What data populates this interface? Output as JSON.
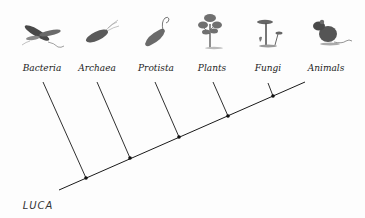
{
  "diagram": {
    "type": "cladogram",
    "root": {
      "label": "LUCA",
      "x": 38,
      "y": 209
    },
    "trunk": {
      "x1": 59,
      "y1": 190,
      "x2": 305,
      "y2": 82
    },
    "colors": {
      "line": "#1a1a1a",
      "icon": "#5a5a5a",
      "icon_dark": "#3a3a3a"
    },
    "taxa": [
      {
        "label": "Bacteria",
        "icon": "bacteria-icon",
        "label_x": 42,
        "label_y": 71,
        "tip": [
          43,
          82
        ],
        "node": [
          86,
          178
        ]
      },
      {
        "label": "Archaea",
        "icon": "archaea-icon",
        "label_x": 97,
        "label_y": 71,
        "tip": [
          97,
          82
        ],
        "node": [
          130,
          158
        ]
      },
      {
        "label": "Protista",
        "icon": "protista-icon",
        "label_x": 156,
        "label_y": 71,
        "tip": [
          155,
          82
        ],
        "node": [
          179,
          137
        ]
      },
      {
        "label": "Plants",
        "icon": "plant-icon",
        "label_x": 212,
        "label_y": 71,
        "tip": [
          213,
          82
        ],
        "node": [
          228,
          116
        ]
      },
      {
        "label": "Fungi",
        "icon": "mushroom-icon",
        "label_x": 268,
        "label_y": 71,
        "tip": [
          268,
          83
        ],
        "node": [
          273,
          96
        ]
      },
      {
        "label": "Animals",
        "icon": "mouse-icon",
        "label_x": 326,
        "label_y": 71,
        "tip": null,
        "node": null
      }
    ]
  }
}
